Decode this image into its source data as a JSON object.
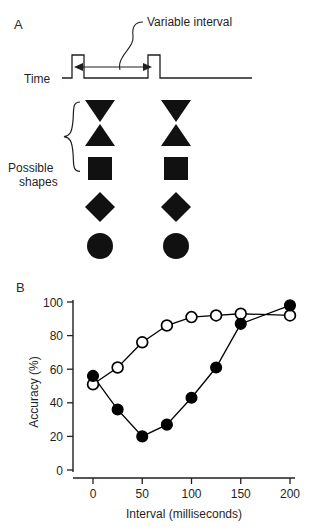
{
  "figure": {
    "panels": [
      {
        "id": "A",
        "label": "A"
      },
      {
        "id": "B",
        "label": "B"
      }
    ]
  },
  "panel_a": {
    "label": "A",
    "annotation_label": "Variable interval",
    "timeline_label": "Time",
    "shapes_label_line1": "Possible",
    "shapes_label_line2": "shapes",
    "shapes_label": "Possible shapes",
    "shape_sequence": [
      "triangle-down",
      "triangle-up",
      "square",
      "diamond",
      "circle"
    ],
    "pulse_count": 2,
    "color_shapes": "#111111",
    "color_lines": "#1f1f1f"
  },
  "chart_data": {
    "type": "line",
    "title": "",
    "xlabel": "Interval (milliseconds)",
    "ylabel": "Accuracy (%)",
    "xlim": [
      0,
      200
    ],
    "ylim": [
      0,
      100
    ],
    "xticks": [
      0,
      50,
      100,
      150,
      200
    ],
    "yticks": [
      0,
      20,
      40,
      60,
      80,
      100
    ],
    "xtick_labels": [
      "0",
      "50",
      "100",
      "150",
      "200"
    ],
    "ytick_labels": [
      "0",
      "20",
      "40",
      "60",
      "80",
      "100"
    ],
    "grid": false,
    "legend": "none",
    "series": [
      {
        "name": "open-circles",
        "marker": "open-circle",
        "color": "#000000",
        "x": [
          0,
          25,
          50,
          75,
          100,
          125,
          150,
          200
        ],
        "values": [
          51,
          61,
          76,
          86,
          91,
          92,
          93,
          92
        ]
      },
      {
        "name": "filled-circles",
        "marker": "filled-circle",
        "color": "#000000",
        "x": [
          0,
          25,
          50,
          75,
          100,
          125,
          150,
          200
        ],
        "values": [
          56,
          36,
          20,
          27,
          43,
          61,
          87,
          98
        ]
      }
    ]
  }
}
